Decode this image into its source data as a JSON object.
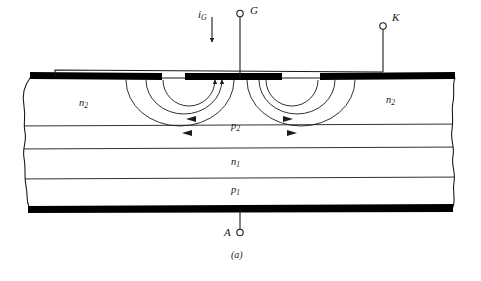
{
  "figure": {
    "caption": "(a)",
    "background_color": "#ffffff",
    "line_color": "#1a1a1a",
    "metal_color": "#000000"
  },
  "terminals": [
    {
      "id": "gate",
      "label": "G",
      "current_label": "iG",
      "current_label_base": "i",
      "current_label_sub": "G",
      "marker": "open-circle",
      "x": 240,
      "y": 13
    },
    {
      "id": "cathode",
      "label": "K",
      "marker": "open-circle",
      "x": 383,
      "y": 25
    },
    {
      "id": "anode",
      "label": "A",
      "marker": "open-circle",
      "x": 240,
      "y": 233
    }
  ],
  "layers": [
    {
      "id": "n2-left",
      "label_base": "n",
      "label_sub": "2",
      "label": "n2",
      "x": 85,
      "y": 104
    },
    {
      "id": "n2-right",
      "label_base": "n",
      "label_sub": "2",
      "label": "n2",
      "x": 392,
      "y": 101
    },
    {
      "id": "p2",
      "label_base": "p",
      "label_sub": "2",
      "label": "p2",
      "x": 237,
      "y": 127
    },
    {
      "id": "n1",
      "label_base": "n",
      "label_sub": "1",
      "label": "n1",
      "x": 237,
      "y": 163
    },
    {
      "id": "p1",
      "label_base": "p",
      "label_sub": "1",
      "label": "p1",
      "x": 237,
      "y": 191
    }
  ],
  "metallization": [
    {
      "id": "cathode-contact-left",
      "x": 30,
      "y": 72,
      "width": 132,
      "height": 7
    },
    {
      "id": "gate-contact",
      "x": 185,
      "y": 73,
      "width": 97,
      "height": 7
    },
    {
      "id": "cathode-contact-right",
      "x": 320,
      "y": 72,
      "width": 135,
      "height": 7
    },
    {
      "id": "anode-contact",
      "x": 28,
      "y": 205,
      "width": 425,
      "height": 7
    }
  ],
  "junction_boundaries": [
    {
      "id": "n2-p2",
      "y": 125
    },
    {
      "id": "p2-n1",
      "y": 148
    },
    {
      "id": "n1-p1",
      "y": 178
    }
  ],
  "current_arcs": [
    {
      "id": "arc-left-inner",
      "side": "left",
      "arrow": "inward"
    },
    {
      "id": "arc-left-mid",
      "side": "left",
      "arrow": "inward"
    },
    {
      "id": "arc-left-outer",
      "side": "left",
      "arrow": "inward"
    },
    {
      "id": "arc-right-inner",
      "side": "right",
      "arrow": "inward"
    },
    {
      "id": "arc-right-mid",
      "side": "right",
      "arrow": "inward"
    },
    {
      "id": "arc-right-outer",
      "side": "right",
      "arrow": "inward"
    }
  ]
}
